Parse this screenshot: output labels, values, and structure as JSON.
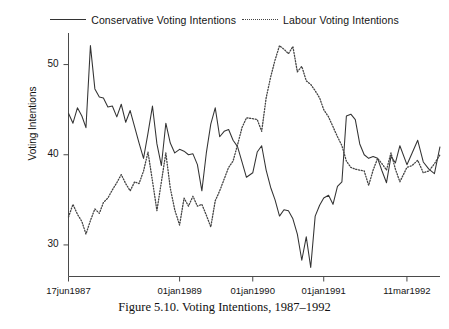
{
  "figure": {
    "caption": "Figure 5.10.  Voting Intentions, 1987–1992",
    "background": "#ffffff"
  },
  "legend": {
    "position": "top-center",
    "entries": [
      {
        "label": "Conservative Voting Intentions",
        "style": "solid",
        "color": "#333333"
      },
      {
        "label": "Labour Voting Intentions",
        "style": "dotted",
        "color": "#444444"
      }
    ]
  },
  "axes": {
    "ylabel": "Voting Intentions",
    "yticks": [
      "30",
      "40",
      "50"
    ],
    "xticks": [
      "17jun1987",
      "01jan1989",
      "01jan1990",
      "01jan1991",
      "11mar1992"
    ]
  },
  "chart_data": {
    "type": "line",
    "title": "Figure 5.10.  Voting Intentions, 1987–1992",
    "xlabel": "",
    "ylabel": "Voting Intentions",
    "ylim": [
      26.5,
      53.5
    ],
    "yticks": [
      30,
      40,
      50
    ],
    "ytick_labels": [
      "30",
      "40",
      "50"
    ],
    "grid": false,
    "legend_position": "top-center",
    "x_axis_type": "date",
    "xlim": [
      "17jun1987",
      "11mar1992"
    ],
    "xticks": [
      "17jun1987",
      "01jan1989",
      "01jan1990",
      "01jan1991",
      "11mar1992"
    ],
    "xtick_positions": [
      0.0,
      0.299,
      0.496,
      0.687,
      0.911
    ],
    "series": [
      {
        "name": "Conservative Voting Intentions",
        "style": "solid",
        "color": "#333333",
        "x": [
          0.0,
          0.012,
          0.024,
          0.036,
          0.047,
          0.059,
          0.071,
          0.083,
          0.094,
          0.106,
          0.118,
          0.13,
          0.142,
          0.154,
          0.166,
          0.178,
          0.19,
          0.202,
          0.214,
          0.226,
          0.238,
          0.25,
          0.262,
          0.274,
          0.286,
          0.299,
          0.311,
          0.323,
          0.335,
          0.347,
          0.359,
          0.371,
          0.383,
          0.395,
          0.407,
          0.419,
          0.431,
          0.443,
          0.455,
          0.467,
          0.479,
          0.496,
          0.508,
          0.52,
          0.532,
          0.544,
          0.556,
          0.568,
          0.58,
          0.592,
          0.604,
          0.616,
          0.628,
          0.64,
          0.652,
          0.664,
          0.676,
          0.687,
          0.7,
          0.712,
          0.724,
          0.736,
          0.748,
          0.76,
          0.772,
          0.784,
          0.796,
          0.808,
          0.82,
          0.832,
          0.844,
          0.856,
          0.868,
          0.88,
          0.892,
          0.911,
          0.925,
          0.94,
          0.955,
          0.97,
          0.985,
          1.0
        ],
        "y": [
          44.6,
          43.5,
          45.2,
          44.3,
          43.0,
          52.1,
          47.3,
          46.4,
          46.3,
          45.3,
          45.4,
          44.2,
          45.6,
          43.6,
          44.9,
          43.1,
          41.3,
          39.6,
          42.4,
          45.4,
          41.2,
          38.8,
          43.5,
          41.3,
          40.2,
          40.6,
          40.4,
          40.0,
          40.1,
          38.9,
          36.0,
          40.2,
          43.4,
          45.2,
          42.0,
          42.6,
          42.8,
          41.6,
          40.9,
          39.2,
          37.5,
          38.0,
          40.3,
          41.0,
          38.3,
          36.4,
          35.0,
          33.2,
          33.9,
          33.8,
          32.9,
          31.2,
          28.3,
          30.9,
          27.5,
          33.2,
          34.4,
          35.2,
          35.5,
          34.5,
          36.5,
          37.0,
          44.3,
          44.5,
          43.9,
          41.2,
          40.0,
          39.6,
          39.8,
          39.6,
          38.2,
          36.9,
          39.8,
          39.1,
          41.0,
          38.9,
          40.2,
          41.6,
          39.2,
          38.4,
          37.9,
          40.9
        ]
      },
      {
        "name": "Labour Voting Intentions",
        "style": "dotted",
        "color": "#444444",
        "x": [
          0.0,
          0.012,
          0.024,
          0.036,
          0.047,
          0.059,
          0.071,
          0.083,
          0.094,
          0.106,
          0.118,
          0.13,
          0.142,
          0.154,
          0.166,
          0.178,
          0.19,
          0.202,
          0.214,
          0.226,
          0.238,
          0.25,
          0.262,
          0.274,
          0.286,
          0.299,
          0.311,
          0.323,
          0.335,
          0.347,
          0.359,
          0.371,
          0.383,
          0.395,
          0.407,
          0.419,
          0.431,
          0.443,
          0.455,
          0.467,
          0.479,
          0.496,
          0.508,
          0.52,
          0.532,
          0.544,
          0.556,
          0.568,
          0.58,
          0.592,
          0.604,
          0.616,
          0.628,
          0.64,
          0.652,
          0.664,
          0.676,
          0.687,
          0.7,
          0.712,
          0.724,
          0.736,
          0.748,
          0.76,
          0.772,
          0.784,
          0.796,
          0.808,
          0.82,
          0.832,
          0.844,
          0.856,
          0.868,
          0.88,
          0.892,
          0.911,
          0.925,
          0.94,
          0.955,
          0.97,
          0.985,
          1.0
        ],
        "y": [
          33.1,
          34.5,
          33.4,
          32.6,
          31.2,
          32.7,
          34.0,
          33.5,
          34.7,
          35.2,
          36.1,
          36.9,
          37.8,
          36.8,
          36.0,
          37.0,
          36.8,
          38.2,
          40.3,
          37.1,
          33.8,
          37.0,
          40.2,
          36.3,
          33.9,
          32.2,
          35.2,
          34.3,
          35.4,
          34.3,
          34.5,
          33.3,
          32.0,
          34.9,
          36.0,
          37.3,
          38.6,
          39.3,
          41.1,
          43.0,
          44.1,
          44.0,
          43.9,
          42.6,
          46.3,
          48.6,
          50.5,
          52.1,
          51.7,
          51.2,
          52.0,
          49.2,
          49.8,
          48.2,
          47.8,
          47.1,
          46.3,
          45.0,
          44.2,
          43.1,
          42.0,
          41.0,
          39.3,
          38.6,
          38.4,
          38.3,
          38.2,
          36.6,
          38.3,
          39.6,
          39.0,
          38.3,
          40.2,
          38.4,
          37.0,
          38.6,
          38.8,
          39.4,
          38.0,
          38.2,
          39.0,
          40.0
        ]
      }
    ]
  }
}
